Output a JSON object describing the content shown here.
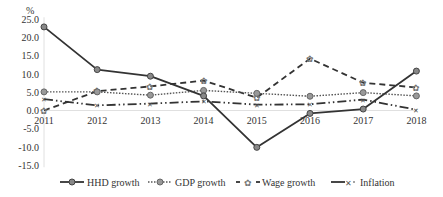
{
  "chart_data": {
    "type": "line",
    "title": "",
    "xlabel": "",
    "ylabel": "%",
    "x": [
      "2011",
      "2012",
      "2013",
      "2014",
      "2015",
      "2016",
      "2017",
      "2018"
    ],
    "ylim": [
      -15.0,
      25.0
    ],
    "yticks": [
      "25.0",
      "20.0",
      "15.0",
      "10.0",
      "5.0",
      "0.0",
      "-5.0",
      "-10.0",
      "-15.0"
    ],
    "grid": false,
    "legend_position": "bottom",
    "series": [
      {
        "name": "HHD growth",
        "style": "solid",
        "marker": "circle",
        "values": [
          22.9,
          11.2,
          9.4,
          4.0,
          -10.1,
          -0.8,
          0.4,
          10.8
        ]
      },
      {
        "name": "GDP growth",
        "style": "dotted",
        "marker": "circle",
        "values": [
          5.1,
          5.1,
          4.2,
          5.5,
          4.7,
          3.9,
          4.9,
          4.0
        ]
      },
      {
        "name": "Wage growth",
        "style": "dashed",
        "marker": "star",
        "values": [
          0.0,
          5.3,
          6.6,
          8.2,
          3.5,
          14.2,
          7.6,
          6.3
        ]
      },
      {
        "name": "Inflation",
        "style": "dash-dot-dot",
        "marker": "cross",
        "values": [
          3.1,
          1.4,
          1.9,
          2.5,
          1.6,
          1.7,
          3.0,
          0.2
        ]
      }
    ]
  },
  "axis": {
    "unit_label": "%"
  },
  "legend": {
    "items": [
      "HHD growth",
      "GDP growth",
      "Wage  growth",
      "Inflation"
    ]
  }
}
